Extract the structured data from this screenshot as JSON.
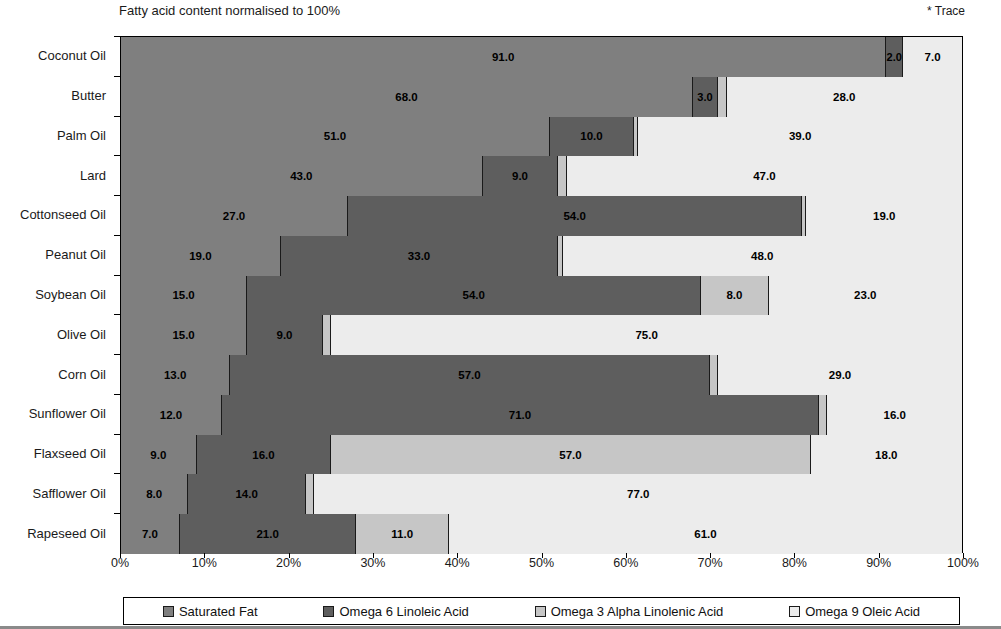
{
  "subtitle": "Fatty acid content normalised to 100%",
  "trace_note": "* Trace",
  "source": "SOURCE: POS PILOT PLANT CORPERATION",
  "title_crop": "Comparison of Dietary Fats",
  "legend": {
    "items": [
      {
        "label": "Saturated Fat",
        "color": "#7f7f7f",
        "icon": "legend-swatch-icon"
      },
      {
        "label": "Omega 6 Linoleic Acid",
        "color": "#5e5e5e",
        "icon": "legend-swatch-icon"
      },
      {
        "label": "Omega 3 Alpha Linolenic Acid",
        "color": "#c6c6c6",
        "icon": "legend-swatch-icon"
      },
      {
        "label": "Omega 9 Oleic Acid",
        "color": "#ececec",
        "icon": "legend-swatch-icon"
      }
    ]
  },
  "chart_data": {
    "type": "bar",
    "orientation": "horizontal",
    "stacked": true,
    "title": "Comparison of Dietary Fats",
    "subtitle": "Fatty acid content normalised to 100%",
    "xlabel": "",
    "ylabel": "",
    "xlim": [
      0,
      100
    ],
    "xticks": [
      "0%",
      "10%",
      "20%",
      "30%",
      "40%",
      "50%",
      "60%",
      "70%",
      "80%",
      "90%",
      "100%"
    ],
    "xtick_values": [
      0,
      10,
      20,
      30,
      40,
      50,
      60,
      70,
      80,
      90,
      100
    ],
    "grid": true,
    "legend_position": "bottom",
    "categories": [
      "Coconut Oil",
      "Butter",
      "Palm Oil",
      "Lard",
      "Cottonseed Oil",
      "Peanut Oil",
      "Soybean Oil",
      "Olive Oil",
      "Corn Oil",
      "Sunflower Oil",
      "Flaxseed Oil",
      "Safflower Oil",
      "Rapeseed Oil"
    ],
    "series": [
      {
        "name": "Saturated Fat",
        "color": "#7f7f7f",
        "values": [
          91.0,
          68.0,
          51.0,
          43.0,
          27.0,
          19.0,
          15.0,
          15.0,
          13.0,
          12.0,
          9.0,
          8.0,
          7.0
        ],
        "labels": [
          "91.0",
          "68.0",
          "51.0",
          "43.0",
          "27.0",
          "19.0",
          "15.0",
          "15.0",
          "13.0",
          "12.0",
          "9.0",
          "8.0",
          "7.0"
        ]
      },
      {
        "name": "Omega 6 Linoleic Acid",
        "color": "#5e5e5e",
        "values": [
          2.0,
          3.0,
          10.0,
          9.0,
          54.0,
          33.0,
          54.0,
          9.0,
          57.0,
          71.0,
          16.0,
          14.0,
          21.0
        ],
        "labels": [
          "2.0",
          "3.0",
          "10.0",
          "9.0",
          "54.0",
          "33.0",
          "54.0",
          "9.0",
          "57.0",
          "71.0",
          "16.0",
          "14.0",
          "21.0"
        ]
      },
      {
        "name": "Omega 3 Alpha Linolenic Acid",
        "color": "#c6c6c6",
        "values": [
          0.0,
          1.0,
          0.5,
          1.0,
          0.5,
          0.5,
          8.0,
          1.0,
          1.0,
          1.0,
          57.0,
          1.0,
          11.0
        ],
        "labels": [
          "",
          "1.0",
          "*",
          "1.0",
          "*",
          "*",
          "8.0",
          "1.0",
          "1.0",
          "1.0",
          "57.0",
          "1.0",
          "11.0"
        ]
      },
      {
        "name": "Omega 9 Oleic Acid",
        "color": "#ececec",
        "values": [
          7.0,
          28.0,
          38.5,
          47.0,
          18.5,
          47.5,
          23.0,
          75.0,
          29.0,
          16.0,
          18.0,
          77.0,
          61.0
        ],
        "labels": [
          "7.0",
          "28.0",
          "39.0",
          "47.0",
          "19.0",
          "48.0",
          "23.0",
          "75.0",
          "29.0",
          "16.0",
          "18.0",
          "77.0",
          "61.0"
        ]
      }
    ]
  }
}
